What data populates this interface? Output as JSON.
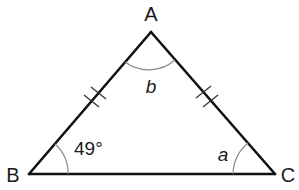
{
  "figure": {
    "type": "isosceles triangle",
    "vertices": {
      "A": {
        "label": "A"
      },
      "B": {
        "label": "B"
      },
      "C": {
        "label": "C"
      }
    },
    "angles": {
      "A": {
        "label": "b"
      },
      "B": {
        "label": "49°"
      },
      "C": {
        "label": "a"
      }
    },
    "congruent_sides": [
      "AB",
      "AC"
    ],
    "tick_marks_per_side": 2,
    "colors": {
      "stroke": "#111111",
      "arc": "#8a8a8a",
      "text": "#1a1a1a"
    }
  }
}
